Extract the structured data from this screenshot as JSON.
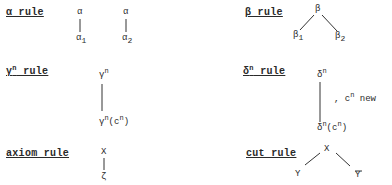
{
  "rules": {
    "alpha": {
      "label": "α rule",
      "branches": [
        {
          "top": "α",
          "bottom": "α",
          "bottom_sub": "1"
        },
        {
          "top": "α",
          "bottom": "α",
          "bottom_sub": "2"
        }
      ]
    },
    "beta": {
      "label": "β rule",
      "top": "β",
      "left": "β",
      "left_sub": "1",
      "right": "β",
      "right_sub": "2"
    },
    "gamma": {
      "label_base": "γ",
      "label_sup": "n",
      "label_rest": " rule",
      "top_base": "γ",
      "top_sup": "n",
      "bottom_base": "γ",
      "bottom_sup": "n",
      "bottom_arg_open": "(c",
      "bottom_arg_sup": "n",
      "bottom_arg_close": ")"
    },
    "delta": {
      "label_base": "δ",
      "label_sup": "n",
      "label_rest": " rule",
      "top_base": "δ",
      "top_sup": "n",
      "bottom_base": "δ",
      "bottom_sup": "n",
      "bottom_arg_open": "(c",
      "bottom_arg_sup": "n",
      "bottom_arg_close": ")",
      "side_note_prefix": ",  c",
      "side_note_sup": "n",
      "side_note_suffix": " new"
    },
    "axiom": {
      "label": "axiom rule",
      "top": "X",
      "bottom": "ζ"
    },
    "cut": {
      "label": "cut rule",
      "top": "X",
      "left": "Y",
      "right": "Y"
    }
  }
}
